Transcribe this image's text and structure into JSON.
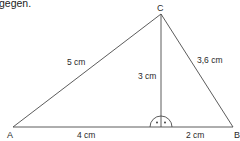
{
  "intro_text": "gegen.",
  "triangle": {
    "vertices": [
      {
        "name": "A",
        "label": "A"
      },
      {
        "name": "B",
        "label": "B"
      },
      {
        "name": "C",
        "label": "C"
      }
    ],
    "sides": {
      "AC": "5 cm",
      "BC": "3,6 cm",
      "altitude_h": "3 cm",
      "AF": "4 cm",
      "FB": "2 cm"
    },
    "right_angle_marker": "semicircle-with-dot"
  },
  "colors": {
    "line": "#4a4a4a",
    "text": "#2a2a2a",
    "background": "#ffffff"
  }
}
